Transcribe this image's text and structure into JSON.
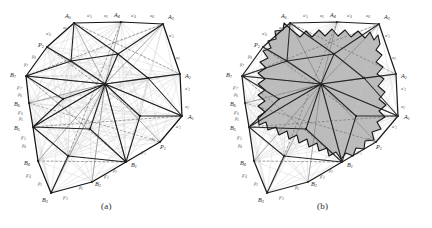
{
  "figure": {
    "caption_a": "(a)",
    "caption_b": "(b)",
    "background_color": "#ffffff",
    "ink_color": "#262626",
    "fill_color": "#b5b5b5",
    "thin_line_color": "#9a9a9a",
    "faint_line_color": "#c2c2c2"
  },
  "panels": [
    {
      "id": "a",
      "label": "(a)",
      "description": "Triangulated polygon with central hub and full diagonal web",
      "shaded": false
    },
    {
      "id": "b",
      "label": "(b)",
      "description": "Same polygon with gray sawtooth inner region shaded",
      "shaded": true
    }
  ],
  "vertices": [
    {
      "name": "A1",
      "base": "A",
      "sub": "1"
    },
    {
      "name": "A2",
      "base": "A",
      "sub": "2"
    },
    {
      "name": "A3",
      "base": "A",
      "sub": "3"
    },
    {
      "name": "A4",
      "base": "A",
      "sub": "4"
    },
    {
      "name": "A5",
      "base": "A",
      "sub": "5"
    },
    {
      "name": "B1",
      "base": "B",
      "sub": "1"
    },
    {
      "name": "B2",
      "base": "B",
      "sub": "2"
    },
    {
      "name": "B3",
      "base": "B",
      "sub": "3"
    },
    {
      "name": "B4",
      "base": "B",
      "sub": "4"
    },
    {
      "name": "B5",
      "base": "B",
      "sub": "5"
    },
    {
      "name": "B6",
      "base": "B",
      "sub": "6"
    },
    {
      "name": "B7",
      "base": "B",
      "sub": "7"
    },
    {
      "name": "P1",
      "base": "P",
      "sub": "1"
    },
    {
      "name": "P2",
      "base": "P",
      "sub": "2"
    }
  ],
  "edge_labels": {
    "alpha": [
      {
        "name": "a1",
        "base": "α",
        "sub": "1",
        "primed": false
      },
      {
        "name": "a2",
        "base": "α",
        "sub": "2",
        "primed": false
      },
      {
        "name": "a3",
        "base": "α",
        "sub": "3",
        "primed": false
      },
      {
        "name": "a4",
        "base": "α",
        "sub": "4",
        "primed": false
      },
      {
        "name": "a5",
        "base": "α",
        "sub": "5",
        "primed": false
      },
      {
        "name": "a1p",
        "base": "α′",
        "sub": "1",
        "primed": true
      },
      {
        "name": "a2p",
        "base": "α′",
        "sub": "2",
        "primed": true
      },
      {
        "name": "a3p",
        "base": "α′",
        "sub": "3",
        "primed": true
      },
      {
        "name": "a4p",
        "base": "α′",
        "sub": "4",
        "primed": true
      },
      {
        "name": "a5p",
        "base": "α′",
        "sub": "5",
        "primed": true
      }
    ],
    "beta": [
      {
        "name": "b1",
        "base": "β",
        "sub": "1",
        "primed": false
      },
      {
        "name": "b2",
        "base": "β",
        "sub": "2",
        "primed": false
      },
      {
        "name": "b3",
        "base": "β",
        "sub": "3",
        "primed": false
      },
      {
        "name": "b4",
        "base": "β",
        "sub": "4",
        "primed": false
      },
      {
        "name": "b5",
        "base": "β",
        "sub": "5",
        "primed": false
      },
      {
        "name": "b6",
        "base": "β",
        "sub": "6",
        "primed": false
      },
      {
        "name": "b7",
        "base": "β",
        "sub": "7",
        "primed": false
      },
      {
        "name": "b1p",
        "base": "β′",
        "sub": "1",
        "primed": true
      },
      {
        "name": "b2p",
        "base": "β′",
        "sub": "2",
        "primed": true
      },
      {
        "name": "b3p",
        "base": "β′",
        "sub": "3",
        "primed": true
      },
      {
        "name": "b4p",
        "base": "β′",
        "sub": "4",
        "primed": true
      },
      {
        "name": "b5p",
        "base": "β′",
        "sub": "5",
        "primed": true
      },
      {
        "name": "b6p",
        "base": "β′",
        "sub": "6",
        "primed": true
      },
      {
        "name": "b7p",
        "base": "β′",
        "sub": "7",
        "primed": true
      }
    ]
  },
  "geometry": {
    "panel_a_origin": {
      "x": 8,
      "y": 6
    },
    "panel_b_origin": {
      "x": 224,
      "y": 6
    },
    "hub": {
      "x": 97,
      "y": 78
    },
    "outline": [
      {
        "v": "A5",
        "x": 66,
        "y": 17
      },
      {
        "v": "A4",
        "x": 113,
        "y": 16
      },
      {
        "v": "A3",
        "x": 155,
        "y": 18
      },
      {
        "v": "A2",
        "x": 172,
        "y": 68
      },
      {
        "v": "A1",
        "x": 174,
        "y": 110
      },
      {
        "v": "P1",
        "x": 152,
        "y": 136
      },
      {
        "v": "B1",
        "x": 118,
        "y": 156
      },
      {
        "v": "B2",
        "x": 84,
        "y": 176
      },
      {
        "v": "B3",
        "x": 43,
        "y": 187
      },
      {
        "v": "B4",
        "x": 30,
        "y": 155
      },
      {
        "v": "B5",
        "x": 25,
        "y": 121
      },
      {
        "v": "B6",
        "x": 21,
        "y": 97
      },
      {
        "v": "B7",
        "x": 18,
        "y": 70
      },
      {
        "v": "P2",
        "x": 39,
        "y": 41
      }
    ],
    "interior_nodes": [
      {
        "x": 97,
        "y": 78
      },
      {
        "x": 63,
        "y": 55
      },
      {
        "x": 110,
        "y": 48
      },
      {
        "x": 140,
        "y": 72
      },
      {
        "x": 132,
        "y": 110
      },
      {
        "x": 82,
        "y": 123
      },
      {
        "x": 55,
        "y": 93
      },
      {
        "x": 60,
        "y": 150
      }
    ]
  },
  "label_positions_a": [
    {
      "ref": "A5",
      "x": 59,
      "y": 12
    },
    {
      "ref": "A4",
      "x": 109,
      "y": 11
    },
    {
      "ref": "A3",
      "x": 160,
      "y": 13
    },
    {
      "ref": "A2",
      "x": 176,
      "y": 69
    },
    {
      "ref": "A1",
      "x": 180,
      "y": 112
    },
    {
      "ref": "P1",
      "x": 153,
      "y": 140
    },
    {
      "ref": "B1",
      "x": 124,
      "y": 160
    },
    {
      "ref": "B2",
      "x": 88,
      "y": 180
    },
    {
      "ref": "B3",
      "x": 37,
      "y": 193
    },
    {
      "ref": "B4",
      "x": 23,
      "y": 159
    },
    {
      "ref": "B5",
      "x": 13,
      "y": 124
    },
    {
      "ref": "B6",
      "x": 13,
      "y": 99
    },
    {
      "ref": "B7",
      "x": 8,
      "y": 71
    },
    {
      "ref": "P2",
      "x": 33,
      "y": 42
    }
  ]
}
